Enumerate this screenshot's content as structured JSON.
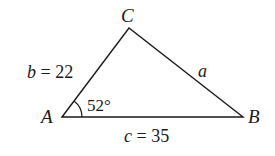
{
  "diagram": {
    "type": "triangle",
    "vertices": {
      "A": {
        "label": "A",
        "x": 62,
        "y": 117
      },
      "B": {
        "label": "B",
        "x": 243,
        "y": 117
      },
      "C": {
        "label": "C",
        "x": 129,
        "y": 28
      }
    },
    "sides": {
      "b": {
        "var": "b",
        "eq": " = ",
        "value": "22"
      },
      "a": {
        "var": "a"
      },
      "c": {
        "var": "c",
        "eq": " = ",
        "value": "35"
      }
    },
    "angle_A": {
      "value": "52°"
    },
    "stroke_color": "#1a1a1a"
  }
}
